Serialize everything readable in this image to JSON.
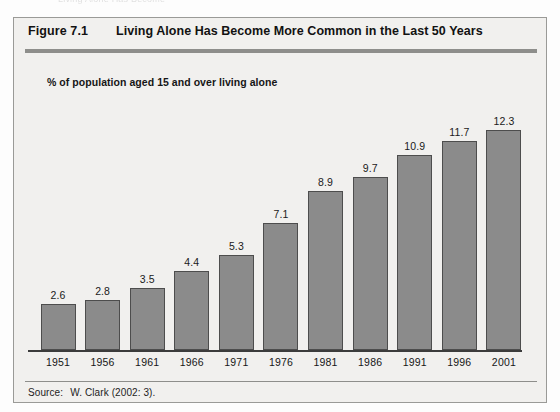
{
  "page": {
    "top_artifact_text": "Living Alone Has Become"
  },
  "figure": {
    "number": "Figure 7.1",
    "title": "Living Alone Has Become More Common in the Last 50 Years",
    "subtitle": "% of population aged 15 and over living alone",
    "source_label": "Source:",
    "source_text": "W. Clark (2002: 3)."
  },
  "colors": {
    "bar_fill": "#8b8b8b",
    "bar_stroke": "#4d4d4d",
    "panel_background": "#f1f0ee",
    "frame_border": "#9a9a97",
    "rule": "#8e8e8b",
    "text": "#161616"
  },
  "chart_data": {
    "type": "bar",
    "title": "Living Alone Has Become More Common in the Last 50 Years",
    "subtitle": "% of population aged 15 and over living alone",
    "categories": [
      "1951",
      "1956",
      "1961",
      "1966",
      "1971",
      "1976",
      "1981",
      "1986",
      "1991",
      "1996",
      "2001"
    ],
    "values": [
      2.6,
      2.8,
      3.5,
      4.4,
      5.3,
      7.1,
      8.9,
      9.7,
      10.9,
      11.7,
      12.3
    ],
    "value_labels": [
      "2.6",
      "2.8",
      "3.5",
      "4.4",
      "5.3",
      "7.1",
      "8.9",
      "9.7",
      "10.9",
      "11.7",
      "12.3"
    ],
    "xlabel": "",
    "ylabel": "% of population aged 15 and over living alone",
    "ylim": [
      0,
      13.5
    ],
    "grid": false,
    "legend": false,
    "data_labels": true,
    "source": "W. Clark (2002: 3)."
  }
}
